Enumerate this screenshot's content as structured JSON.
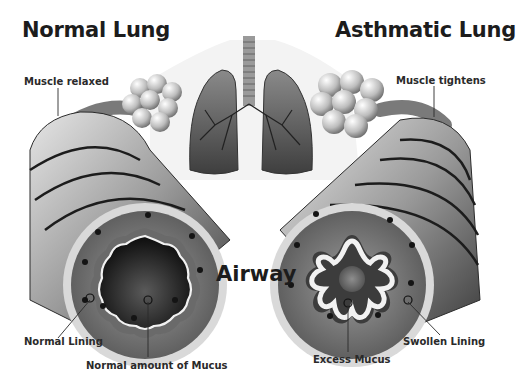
{
  "titles": {
    "left": "Normal Lung",
    "right": "Asthmatic Lung",
    "center": "Airway"
  },
  "labels": {
    "normal": {
      "muscle": "Muscle relaxed",
      "lining": "Normal Lining",
      "mucus": "Normal amount of Mucus"
    },
    "asthmatic": {
      "muscle": "Muscle tightens",
      "lining": "Swollen Lining",
      "mucus": "Excess Mucus"
    }
  },
  "figure": {
    "subjects": [
      "lungs-with-trachea",
      "normal-airway-cross-section",
      "asthmatic-airway-cross-section",
      "alveoli-clusters"
    ],
    "palette": {
      "background": "#ffffff",
      "ink": "#1c1c1c",
      "airway_mid": "#8a8a8a",
      "airway_dark": "#2b2b2b",
      "lining_highlight": "#f2f2f2"
    }
  }
}
